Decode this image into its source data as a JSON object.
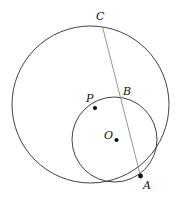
{
  "figure": {
    "background_color": "#ffffff",
    "width": 183,
    "height": 202,
    "circle_color": "#2b2b2b",
    "chord_color": "#8a8a8a",
    "dot_color": "#111111"
  },
  "labels": {
    "C": "C",
    "B": "B",
    "P": "P",
    "O": "O",
    "A": "A"
  },
  "chart_data": {
    "type": "diagram",
    "shapes": [
      {
        "name": "large-circle",
        "kind": "circle",
        "cx": 90.5,
        "cy": 104.5,
        "r": 78.5,
        "stroke": "#2b2b2b",
        "fill": "none"
      },
      {
        "name": "small-circle",
        "kind": "circle",
        "cx": 114.5,
        "cy": 139.5,
        "r": 42.5,
        "stroke": "#2b2b2b",
        "fill": "none"
      },
      {
        "name": "chord-CA",
        "kind": "segment",
        "x1": 102.5,
        "y1": 27.0,
        "x2": 140.5,
        "y2": 176.0,
        "stroke": "#8a8a8a"
      }
    ],
    "points": [
      {
        "name": "C",
        "x": 102.5,
        "y": 27.0,
        "marked": false,
        "label_x": 96,
        "label_y": 11
      },
      {
        "name": "B",
        "x": 120.0,
        "y": 99.0,
        "marked": false,
        "label_x": 123,
        "label_y": 86
      },
      {
        "name": "P",
        "x": 95.0,
        "y": 108.0,
        "marked": true,
        "label_x": 86,
        "label_y": 93
      },
      {
        "name": "O",
        "x": 116.5,
        "y": 140.0,
        "marked": true,
        "label_x": 104,
        "label_y": 130
      },
      {
        "name": "A",
        "x": 140.5,
        "y": 176.0,
        "marked": true,
        "label_x": 143,
        "label_y": 180
      }
    ]
  }
}
